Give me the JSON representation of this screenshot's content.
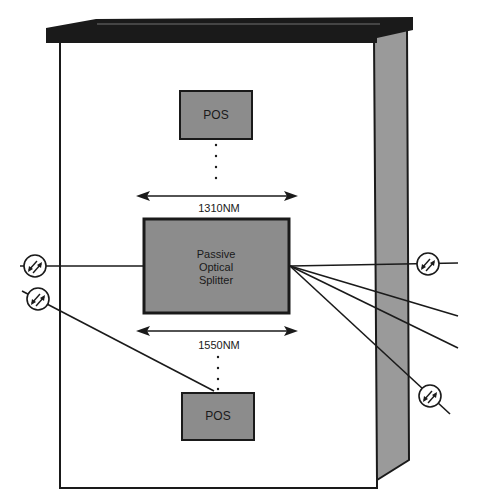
{
  "diagram": {
    "type": "passive-optical-network-cabinet",
    "top_pos": {
      "label": "POS"
    },
    "bottom_pos": {
      "label": "POS"
    },
    "upstream_wavelength": {
      "label": "1310NM"
    },
    "downstream_wavelength": {
      "label": "1550NM"
    },
    "splitter": {
      "line1": "Passive",
      "line2": "Optical",
      "line3": "Splitter"
    },
    "colors": {
      "lid": "#1a1a1a",
      "side_panel": "#999999",
      "box_fill": "#8c8c8c",
      "line": "#1a1a1a",
      "background": "#ffffff"
    }
  }
}
